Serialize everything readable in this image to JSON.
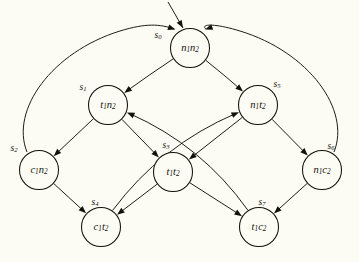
{
  "figure": {
    "kind": "state-transition-diagram",
    "background_color": "#fdfcf4",
    "ink_color": "#13110c",
    "node_radius": 19.5,
    "initial_marker": {
      "name": "initial-state-arrow",
      "target": "s0",
      "from_x": 168,
      "from_y": 2,
      "to_x": 183,
      "to_y": 28
    }
  },
  "nodes": [
    {
      "id": "s0",
      "state_label": "s",
      "state_sub": "0",
      "value_parts": [
        "n",
        "1",
        "n",
        "2"
      ],
      "cx": 190,
      "cy": 48,
      "name_x": 158,
      "name_y": 36
    },
    {
      "id": "s1",
      "state_label": "s",
      "state_sub": "1",
      "value_parts": [
        "t",
        "1",
        "n",
        "2"
      ],
      "cx": 108,
      "cy": 105,
      "name_x": 83,
      "name_y": 88
    },
    {
      "id": "s5",
      "state_label": "s",
      "state_sub": "5",
      "value_parts": [
        "n",
        "1",
        "t",
        "2"
      ],
      "cx": 258,
      "cy": 105,
      "name_x": 277,
      "name_y": 85
    },
    {
      "id": "s2",
      "state_label": "s",
      "state_sub": "2",
      "value_parts": [
        "c",
        "1",
        "n",
        "2"
      ],
      "cx": 39,
      "cy": 170,
      "name_x": 14,
      "name_y": 149
    },
    {
      "id": "s3",
      "state_label": "s",
      "state_sub": "3",
      "value_parts": [
        "t",
        "1",
        "t",
        "2"
      ],
      "cx": 173,
      "cy": 172,
      "name_x": 166,
      "name_y": 146
    },
    {
      "id": "s6",
      "state_label": "s",
      "state_sub": "6",
      "value_parts": [
        "n",
        "1",
        "c",
        "2"
      ],
      "cx": 322,
      "cy": 170,
      "name_x": 331,
      "name_y": 147
    },
    {
      "id": "s4",
      "state_label": "s",
      "state_sub": "4",
      "value_parts": [
        "c",
        "1",
        "t",
        "2"
      ],
      "cx": 101,
      "cy": 227,
      "name_x": 95,
      "name_y": 203
    },
    {
      "id": "s7",
      "state_label": "s",
      "state_sub": "7",
      "value_parts": [
        "t",
        "1",
        "c",
        "2"
      ],
      "cx": 259,
      "cy": 227,
      "name_x": 262,
      "name_y": 203
    }
  ],
  "edges": [
    {
      "from": "s0",
      "to": "s1",
      "name": "edge-s0-s1"
    },
    {
      "from": "s0",
      "to": "s5",
      "name": "edge-s0-s5"
    },
    {
      "from": "s1",
      "to": "s2",
      "name": "edge-s1-s2"
    },
    {
      "from": "s1",
      "to": "s3",
      "name": "edge-s1-s3"
    },
    {
      "from": "s5",
      "to": "s3",
      "name": "edge-s5-s3"
    },
    {
      "from": "s5",
      "to": "s6",
      "name": "edge-s5-s6"
    },
    {
      "from": "s2",
      "to": "s4",
      "name": "edge-s2-s4"
    },
    {
      "from": "s2",
      "to": "s0",
      "name": "edge-s2-s0-outer"
    },
    {
      "from": "s6",
      "to": "s7",
      "name": "edge-s6-s7"
    },
    {
      "from": "s6",
      "to": "s0",
      "name": "edge-s6-s0-outer"
    },
    {
      "from": "s3",
      "to": "s4",
      "name": "edge-s3-s4"
    },
    {
      "from": "s3",
      "to": "s7",
      "name": "edge-s3-s7"
    },
    {
      "from": "s4",
      "to": "s5",
      "name": "edge-s4-s5-curve"
    },
    {
      "from": "s7",
      "to": "s1",
      "name": "edge-s7-s1-curve"
    }
  ]
}
